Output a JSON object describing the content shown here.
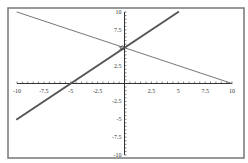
{
  "chart_data": {
    "type": "line",
    "title": "",
    "xlabel": "",
    "ylabel": "",
    "xlim": [
      -10,
      10
    ],
    "ylim": [
      -10,
      10
    ],
    "grid": false,
    "x_ticks": [
      "-10",
      "-7.5",
      "-5",
      "-2.5",
      "2.5",
      "5",
      "7.5",
      "10"
    ],
    "x_tick_values": [
      -10,
      -7.5,
      -5,
      -2.5,
      2.5,
      5,
      7.5,
      10
    ],
    "y_ticks": [
      "10",
      "7.5",
      "5",
      "2.5",
      "-2.5",
      "-5",
      "-7.5",
      "-10"
    ],
    "y_tick_values": [
      10,
      7.5,
      5,
      2.5,
      -2.5,
      -5,
      -7.5,
      -10
    ],
    "series": [
      {
        "name": "y = x + 5",
        "style": "thick",
        "color": "#555555",
        "x": [
          -10,
          5
        ],
        "y": [
          -5,
          10
        ]
      },
      {
        "name": "y = -0.5x + 5",
        "style": "thin",
        "color": "#666666",
        "x": [
          -10,
          10
        ],
        "y": [
          10,
          0
        ]
      }
    ],
    "annotations": [
      {
        "type": "point-marker",
        "x": 0,
        "y": 5,
        "label": "intersection"
      }
    ]
  },
  "colors": {
    "frame": "#777777",
    "axis": "#333333",
    "background": "#ffffff"
  }
}
